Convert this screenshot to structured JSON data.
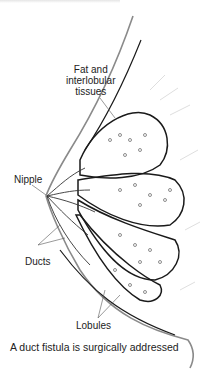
{
  "figure": {
    "type": "anatomical illustration",
    "labels": {
      "fat": [
        "Fat and",
        "interlobular",
        "tissues"
      ],
      "nipple": "Nipple",
      "ducts": "Ducts",
      "lobules": "Lobules"
    },
    "caption": "A duct fistula is surgically addressed",
    "colors": {
      "line": "#1a1a1a",
      "skin": "#8a8a8a",
      "faint": "#c8c8c8",
      "background": "#ffffff"
    }
  }
}
